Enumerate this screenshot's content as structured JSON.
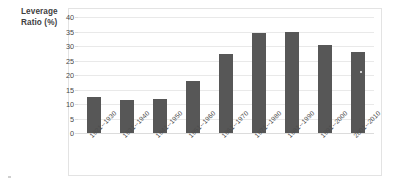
{
  "axis_title": {
    "line1": "Leverage",
    "line2": "Ratio (%)"
  },
  "chart_data": {
    "type": "bar",
    "title": "",
    "subtitle": "",
    "xlabel": "",
    "ylabel": "Leverage Ratio (%)",
    "ylim": [
      0,
      40
    ],
    "ytick_step": 5,
    "grid": true,
    "legend": false,
    "bar_color": "#575757",
    "gridline_color": "#e9e9e9",
    "categories": [
      "1921--1930",
      "1931--1940",
      "1941--1950",
      "1951--1960",
      "1961--1970",
      "1971--1980",
      "1981--1990",
      "1991--2000",
      "2001--2010"
    ],
    "values": [
      12.3,
      11.5,
      11.8,
      18.0,
      27.4,
      34.4,
      34.9,
      30.5,
      27.8
    ],
    "ytick_labels": [
      "40",
      "35",
      "30",
      "25",
      "20",
      "15",
      "10",
      "5",
      "0"
    ],
    "ytick_values": [
      40,
      35,
      30,
      25,
      20,
      15,
      10,
      5,
      0
    ]
  }
}
